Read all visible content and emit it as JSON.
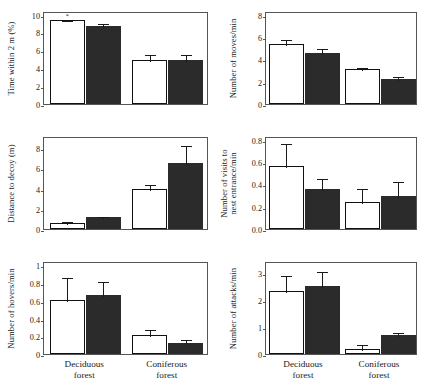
{
  "figure": {
    "groups": [
      "Deciduous forest",
      "Coniferous forest"
    ],
    "group_labels": [
      {
        "line1": "Deciduous",
        "line2": "forest"
      },
      {
        "line1": "Coniferous",
        "line2": "forest"
      }
    ],
    "series": [
      {
        "name": "open",
        "fill": "#ffffff",
        "stroke": "#111111"
      },
      {
        "name": "filled",
        "fill": "#2b2b2b",
        "stroke": "#2b2b2b"
      }
    ],
    "significance_marker": "*"
  },
  "chart_data": [
    {
      "id": "time-within-2m",
      "type": "bar",
      "title": "",
      "ylabel": "Time within 2 m (%)",
      "xlabel": "",
      "categories": [
        "Deciduous forest",
        "Coniferous forest"
      ],
      "ylim": [
        0,
        10.4
      ],
      "yticks": [
        0,
        2,
        4,
        6,
        8,
        10
      ],
      "yticklabels": [
        "0",
        "2",
        "4",
        "6",
        "8",
        "10"
      ],
      "grid": false,
      "legend": "none",
      "series": [
        {
          "name": "open",
          "values": [
            9.35,
            4.9
          ],
          "errors": [
            0.12,
            0.75
          ]
        },
        {
          "name": "filled",
          "values": [
            8.7,
            4.9
          ],
          "errors": [
            0.45,
            0.8
          ]
        }
      ],
      "annotations": [
        {
          "text": "*",
          "group": 0,
          "series": "open"
        }
      ]
    },
    {
      "id": "number-of-moves",
      "type": "bar",
      "title": "",
      "ylabel": "Number of moves/min",
      "xlabel": "",
      "categories": [
        "Deciduous forest",
        "Coniferous forest"
      ],
      "ylim": [
        0,
        8.35
      ],
      "yticks": [
        0,
        2,
        4,
        6,
        8
      ],
      "yticklabels": [
        "0",
        "2",
        "4",
        "6",
        "8"
      ],
      "grid": false,
      "legend": "none",
      "series": [
        {
          "name": "open",
          "values": [
            5.35,
            3.1
          ],
          "errors": [
            0.55,
            0.3
          ]
        },
        {
          "name": "filled",
          "values": [
            4.55,
            2.25
          ],
          "errors": [
            0.6,
            0.33
          ]
        }
      ],
      "annotations": []
    },
    {
      "id": "distance-to-decoy",
      "type": "bar",
      "title": "",
      "ylabel": "Distance to decoy (m)",
      "xlabel": "",
      "categories": [
        "Deciduous forest",
        "Coniferous forest"
      ],
      "ylim": [
        0,
        9.2
      ],
      "yticks": [
        0,
        2,
        4,
        6,
        8
      ],
      "yticklabels": [
        "0",
        "2",
        "4",
        "6",
        "8"
      ],
      "grid": false,
      "legend": "none",
      "series": [
        {
          "name": "open",
          "values": [
            0.6,
            3.95
          ],
          "errors": [
            0.3,
            0.62
          ]
        },
        {
          "name": "filled",
          "values": [
            1.2,
            6.5
          ],
          "errors": [
            0.2,
            1.9
          ]
        }
      ],
      "annotations": []
    },
    {
      "id": "visits-to-nest-entrance",
      "type": "bar",
      "title": "",
      "ylabel_line1": "Number of visits to",
      "ylabel_line2": "nest entrance/min",
      "ylabel": "Number of visits to nest entrance/min",
      "xlabel": "",
      "categories": [
        "Deciduous forest",
        "Coniferous forest"
      ],
      "ylim": [
        0,
        0.835
      ],
      "yticks": [
        0,
        0.2,
        0.4,
        0.6,
        0.8
      ],
      "yticklabels": [
        "0.0",
        "0.2",
        "0.4",
        "0.6",
        "0.8"
      ],
      "grid": false,
      "legend": "none",
      "series": [
        {
          "name": "open",
          "values": [
            0.57,
            0.245
          ],
          "errors": [
            0.21,
            0.135
          ]
        },
        {
          "name": "filled",
          "values": [
            0.355,
            0.295
          ],
          "errors": [
            0.115,
            0.145
          ]
        }
      ],
      "annotations": []
    },
    {
      "id": "number-of-hovers",
      "type": "bar",
      "title": "",
      "ylabel": "Number of hovers/min",
      "xlabel": "",
      "categories": [
        "Deciduous forest",
        "Coniferous forest"
      ],
      "ylim": [
        0,
        1.05
      ],
      "yticks": [
        0,
        0.2,
        0.4,
        0.6,
        0.8,
        1
      ],
      "yticklabels": [
        "0",
        "0.2",
        "0.4",
        "0.6",
        "0.8",
        "1"
      ],
      "grid": false,
      "legend": "none",
      "series": [
        {
          "name": "open",
          "values": [
            0.61,
            0.21
          ],
          "errors": [
            0.27,
            0.08
          ]
        },
        {
          "name": "filled",
          "values": [
            0.665,
            0.125
          ],
          "errors": [
            0.165,
            0.06
          ]
        }
      ],
      "annotations": []
    },
    {
      "id": "number-of-attacks",
      "type": "bar",
      "title": "",
      "ylabel": "Number of attacks/min",
      "xlabel": "",
      "categories": [
        "Deciduous forest",
        "Coniferous forest"
      ],
      "ylim": [
        0,
        3.45
      ],
      "yticks": [
        0,
        1,
        2,
        3
      ],
      "yticklabels": [
        "0",
        "1",
        "2",
        "3"
      ],
      "grid": false,
      "legend": "none",
      "series": [
        {
          "name": "open",
          "values": [
            2.35,
            0.2
          ],
          "errors": [
            0.62,
            0.22
          ]
        },
        {
          "name": "filled",
          "values": [
            2.53,
            0.7
          ],
          "errors": [
            0.58,
            0.17
          ]
        }
      ],
      "annotations": []
    }
  ]
}
